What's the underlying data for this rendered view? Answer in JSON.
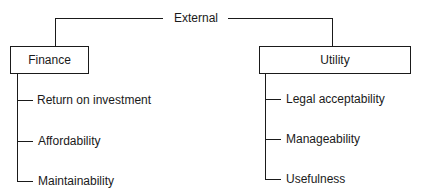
{
  "diagram": {
    "root": {
      "label": "External"
    },
    "branches": [
      {
        "label": "Finance",
        "children": [
          "Return on investment",
          "Affordability",
          "Maintainability"
        ]
      },
      {
        "label": "Utility",
        "children": [
          "Legal acceptability",
          "Manageability",
          "Usefulness"
        ]
      }
    ]
  }
}
